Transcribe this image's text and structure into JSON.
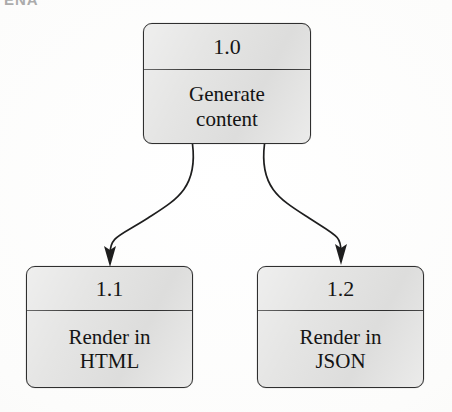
{
  "page": {
    "background_color": "#fdfdfc",
    "clipped_running_head": "ENA"
  },
  "diagram": {
    "type": "flow-decomposition",
    "box_fill_color": "#e4e4e3",
    "box_border_color": "#2f2f2f",
    "connector_color": "#1e1e1e",
    "nodes": [
      {
        "key": "parent",
        "id": "1.0",
        "label": "Generate\ncontent",
        "x": 143,
        "y": 23,
        "width": 168,
        "height": 121
      },
      {
        "key": "child_left",
        "id": "1.1",
        "label": "Render in\nHTML",
        "x": 26,
        "y": 266,
        "width": 167,
        "height": 122
      },
      {
        "key": "child_right",
        "id": "1.2",
        "label": "Render in\nJSON",
        "x": 257,
        "y": 266,
        "width": 167,
        "height": 122
      }
    ],
    "edges": [
      {
        "key": "edge_left",
        "from": "1.0",
        "to": "1.1",
        "style": "curved-arrow",
        "arrowhead": "filled-triangle"
      },
      {
        "key": "edge_right",
        "from": "1.0",
        "to": "1.2",
        "style": "curved-arrow",
        "arrowhead": "filled-triangle"
      }
    ]
  }
}
